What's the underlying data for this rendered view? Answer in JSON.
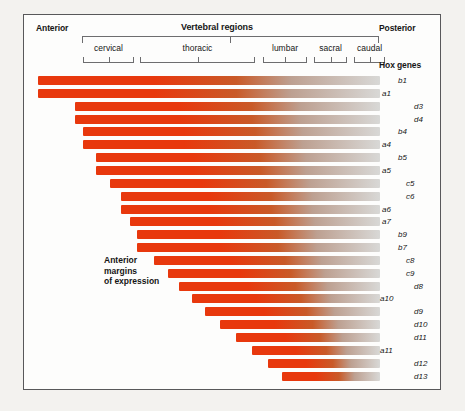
{
  "figure": {
    "axis_labels": {
      "anterior": "Anterior",
      "posterior": "Posterior"
    },
    "regions_title": "Vertebral regions",
    "genes_title": "Hox genes",
    "annotation": [
      "Anterior",
      "margins",
      "of expression"
    ],
    "regions": [
      {
        "name": "cervical",
        "start": 59,
        "end": 110
      },
      {
        "name": "thoracic",
        "start": 116,
        "end": 231
      },
      {
        "name": "lumbar",
        "start": 239,
        "end": 283
      },
      {
        "name": "sacral",
        "start": 290,
        "end": 323
      },
      {
        "name": "caudal",
        "start": 330,
        "end": 361
      }
    ],
    "bar_colors": {
      "start": "#E8380D",
      "end": "#D8D8D6"
    },
    "bar_right_edge": 356,
    "rows": [
      {
        "gene": "b1",
        "start": 14,
        "label_x": 62
      },
      {
        "gene": "a1",
        "start": 14,
        "label_x": 46
      },
      {
        "gene": "d3",
        "start": 51,
        "label_x": 78
      },
      {
        "gene": "d4",
        "start": 51,
        "label_x": 78
      },
      {
        "gene": "b4",
        "start": 59,
        "label_x": 62
      },
      {
        "gene": "a4",
        "start": 59,
        "label_x": 46
      },
      {
        "gene": "b5",
        "start": 72,
        "label_x": 62
      },
      {
        "gene": "a5",
        "start": 72,
        "label_x": 46
      },
      {
        "gene": "c5",
        "start": 86,
        "label_x": 70
      },
      {
        "gene": "c6",
        "start": 97,
        "label_x": 70
      },
      {
        "gene": "a6",
        "start": 97,
        "label_x": 46
      },
      {
        "gene": "a7",
        "start": 106,
        "label_x": 46
      },
      {
        "gene": "b9",
        "start": 113,
        "label_x": 62
      },
      {
        "gene": "b7",
        "start": 113,
        "label_x": 62
      },
      {
        "gene": "c8",
        "start": 130,
        "label_x": 70
      },
      {
        "gene": "c9",
        "start": 144,
        "label_x": 70
      },
      {
        "gene": "d8",
        "start": 155,
        "label_x": 78
      },
      {
        "gene": "a10",
        "start": 168,
        "label_x": 44
      },
      {
        "gene": "d9",
        "start": 181,
        "label_x": 78
      },
      {
        "gene": "d10",
        "start": 196,
        "label_x": 78
      },
      {
        "gene": "d11",
        "start": 212,
        "label_x": 78
      },
      {
        "gene": "a11",
        "start": 228,
        "label_x": 44
      },
      {
        "gene": "d12",
        "start": 244,
        "label_x": 78
      },
      {
        "gene": "d13",
        "start": 258,
        "label_x": 78
      }
    ]
  }
}
